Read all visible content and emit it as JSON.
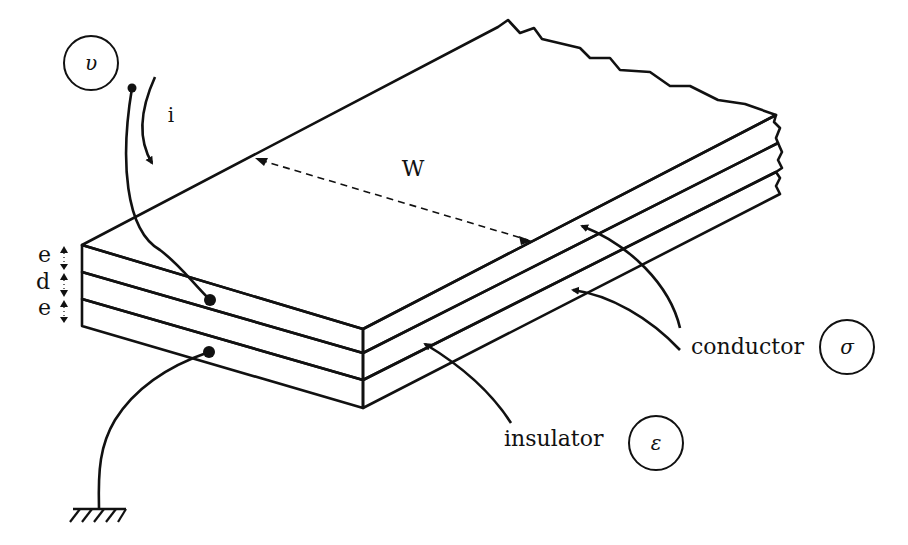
{
  "figure": {
    "type": "isometric cross-section of a layered strip conductor",
    "colors": {
      "ink": "#111111",
      "background": "#ffffff"
    }
  },
  "labels": {
    "voltage_symbol": "υ",
    "current_symbol": "i",
    "width_label": "W",
    "thickness_top": "e",
    "thickness_middle": "d",
    "thickness_bottom": "e",
    "conductor_label": "conductor",
    "conductor_symbol": "σ",
    "insulator_label": "insulator",
    "insulator_symbol": "ε"
  },
  "layers": [
    {
      "name": "conductor",
      "thickness_symbol": "e",
      "pattern": "blank"
    },
    {
      "name": "insulator",
      "thickness_symbol": "d",
      "pattern": "hatched"
    },
    {
      "name": "conductor",
      "thickness_symbol": "e",
      "pattern": "blank"
    }
  ],
  "connections": [
    {
      "from": "voltage terminal υ",
      "to": "top conductor",
      "marker": "dot"
    },
    {
      "from": "bottom conductor",
      "to": "ground",
      "marker": "dot"
    }
  ]
}
